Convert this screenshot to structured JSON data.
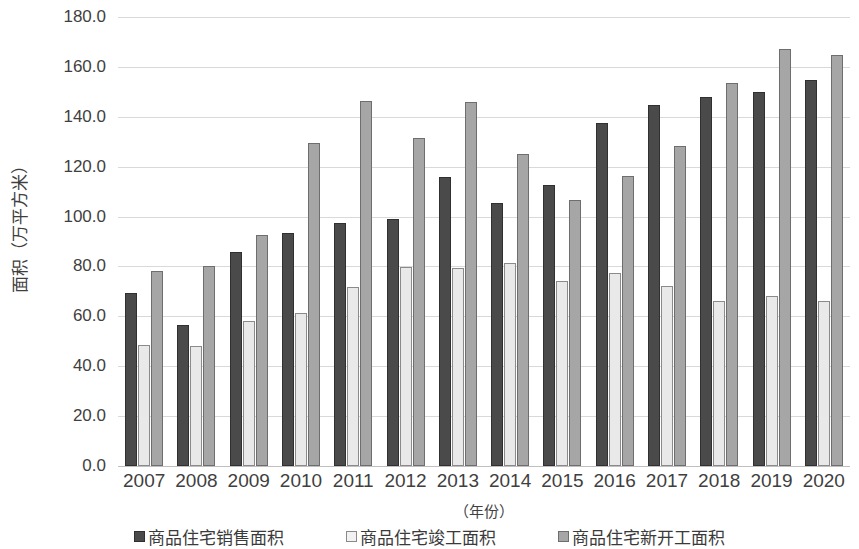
{
  "chart_data": {
    "type": "bar",
    "title": "",
    "subtitle": "",
    "xlabel": "（年份）",
    "ylabel": "面积（万平方米）",
    "ylim": [
      0,
      180
    ],
    "ytick_step": 20,
    "ytick_labels": [
      "180.0",
      "160.0",
      "140.0",
      "120.0",
      "100.0",
      "80.0",
      "60.0",
      "40.0",
      "20.0",
      "0.0"
    ],
    "grid": true,
    "legend_position": "bottom",
    "categories": [
      "2007",
      "2008",
      "2009",
      "2010",
      "2011",
      "2012",
      "2013",
      "2014",
      "2015",
      "2016",
      "2017",
      "2018",
      "2019",
      "2020"
    ],
    "series": [
      {
        "name": "商品住宅销售面积",
        "color": "#4a4a4a",
        "values": [
          69.4,
          56.6,
          85.6,
          93.4,
          97.6,
          99.0,
          116.0,
          105.5,
          112.6,
          137.5,
          144.6,
          148.0,
          150.0,
          154.8
        ]
      },
      {
        "name": "商品住宅竣工面积",
        "color": "#e9e9e9",
        "values": [
          48.4,
          48.2,
          58.2,
          61.4,
          71.8,
          79.6,
          79.2,
          81.2,
          74.0,
          77.2,
          72.2,
          66.2,
          68.2,
          66.1
        ]
      },
      {
        "name": "商品住宅新开工面积",
        "color": "#a6a6a6",
        "values": [
          78.2,
          80.1,
          92.8,
          129.6,
          146.2,
          131.3,
          145.8,
          124.9,
          106.8,
          116.1,
          128.3,
          153.4,
          167.0,
          164.6
        ]
      }
    ]
  }
}
